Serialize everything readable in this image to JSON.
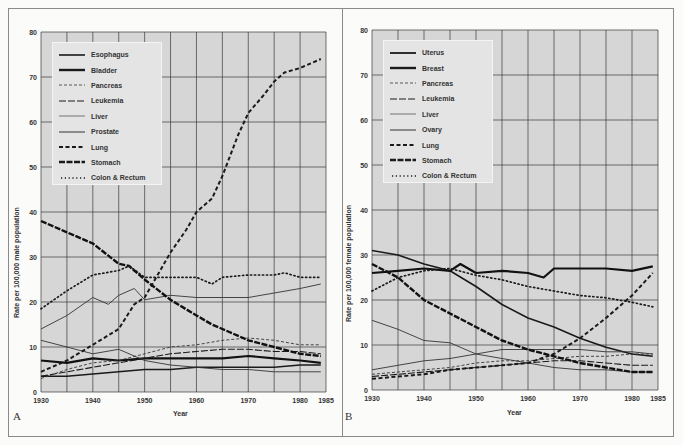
{
  "panels": [
    {
      "letter": "A",
      "ylabel": "Rate per 100,000 male population",
      "xlabel": "Year",
      "legend": [
        "Esophagus",
        "Bladder",
        "Pancreas",
        "Leukemia",
        "Liver",
        "Prostate",
        "Lung",
        "Stomach",
        "Colon & Rectum"
      ]
    },
    {
      "letter": "B",
      "ylabel": "Rate per 100,000 female population",
      "xlabel": "Year",
      "legend": [
        "Uterus",
        "Breast",
        "Pancreas",
        "Leukemia",
        "Liver",
        "Ovary",
        "Lung",
        "Stomach",
        "Colon & Rectum"
      ]
    }
  ],
  "colors": {
    "plot_bg": "#d6d6d6",
    "grid": "#3a3a3a",
    "line": "#1a1a1a",
    "legend_bg": "#e4e4e4"
  },
  "chart_data": [
    {
      "type": "line",
      "title": "A",
      "xlabel": "Year",
      "ylabel": "Rate per 100,000 male population",
      "xlim": [
        1930,
        1985
      ],
      "ylim": [
        0,
        80
      ],
      "xticks": [
        1930,
        1940,
        1950,
        1960,
        1970,
        1980,
        1985
      ],
      "yticks": [
        0,
        10,
        20,
        30,
        40,
        50,
        60,
        70,
        80
      ],
      "grid": true,
      "legend_position": "upper left",
      "series": [
        {
          "name": "Esophagus",
          "style": "solid-medium",
          "x": [
            1930,
            1935,
            1940,
            1945,
            1950,
            1955,
            1960,
            1965,
            1970,
            1975,
            1980,
            1984
          ],
          "y": [
            3.5,
            3.5,
            4,
            4.5,
            5,
            5,
            5.5,
            5.5,
            5.5,
            5.5,
            6,
            6
          ]
        },
        {
          "name": "Bladder",
          "style": "solid-thick",
          "x": [
            1930,
            1935,
            1940,
            1945,
            1950,
            1955,
            1960,
            1965,
            1970,
            1975,
            1980,
            1984
          ],
          "y": [
            7,
            6.5,
            7.5,
            7,
            7.5,
            7.5,
            7.5,
            7.5,
            8,
            7.5,
            7,
            6.5
          ]
        },
        {
          "name": "Pancreas",
          "style": "dashed-thin",
          "x": [
            1930,
            1935,
            1940,
            1945,
            1950,
            1955,
            1960,
            1965,
            1970,
            1975,
            1980,
            1984
          ],
          "y": [
            3,
            5,
            6.5,
            7,
            8.5,
            10,
            10.5,
            11.5,
            12,
            11.5,
            10.5,
            10.5
          ]
        },
        {
          "name": "Leukemia",
          "style": "longdash-medium",
          "x": [
            1930,
            1935,
            1940,
            1945,
            1950,
            1955,
            1960,
            1965,
            1970,
            1975,
            1980,
            1984
          ],
          "y": [
            3.5,
            4.5,
            5.5,
            6.5,
            7.5,
            8.5,
            9,
            9.5,
            9.5,
            9,
            9,
            8.5
          ]
        },
        {
          "name": "Liver",
          "style": "solid-thin",
          "x": [
            1930,
            1935,
            1940,
            1945,
            1950,
            1955,
            1960,
            1965,
            1970,
            1975,
            1980,
            1984
          ],
          "y": [
            11.5,
            10,
            8.5,
            9.5,
            7,
            6,
            5.5,
            5,
            5,
            4.5,
            4.5,
            4.5
          ]
        },
        {
          "name": "Prostate",
          "style": "solid-thin",
          "x": [
            1930,
            1935,
            1940,
            1943,
            1945,
            1948,
            1950,
            1955,
            1960,
            1965,
            1970,
            1975,
            1980,
            1984
          ],
          "y": [
            14,
            17,
            21,
            19.5,
            21.5,
            23,
            20.5,
            21.5,
            21,
            21,
            21,
            22,
            23,
            24
          ]
        },
        {
          "name": "Lung",
          "style": "dashed-thick",
          "x": [
            1930,
            1935,
            1940,
            1945,
            1948,
            1950,
            1953,
            1955,
            1958,
            1960,
            1963,
            1965,
            1968,
            1970,
            1973,
            1975,
            1977,
            1980,
            1984
          ],
          "y": [
            4.5,
            7,
            10.5,
            14,
            19.5,
            21,
            27,
            31,
            36,
            40,
            43,
            48,
            57,
            62,
            66,
            69,
            71,
            72,
            74
          ]
        },
        {
          "name": "Stomach",
          "style": "dashed-heavy",
          "x": [
            1930,
            1935,
            1940,
            1945,
            1947,
            1950,
            1955,
            1960,
            1963,
            1965,
            1970,
            1975,
            1980,
            1984
          ],
          "y": [
            38,
            35.5,
            33,
            28.5,
            28,
            25,
            20.5,
            17,
            15,
            14,
            11.5,
            10,
            8.5,
            8
          ]
        },
        {
          "name": "Colon & Rectum",
          "style": "dotted",
          "x": [
            1930,
            1935,
            1940,
            1945,
            1947,
            1950,
            1955,
            1960,
            1963,
            1965,
            1970,
            1975,
            1977,
            1980,
            1984
          ],
          "y": [
            18.5,
            22.5,
            26,
            27,
            28,
            25.5,
            25.5,
            25.5,
            24,
            25.5,
            26,
            26,
            26.5,
            25.5,
            25.5
          ]
        }
      ]
    },
    {
      "type": "line",
      "title": "B",
      "xlabel": "Year",
      "ylabel": "Rate per 100,000 female population",
      "xlim": [
        1930,
        1985
      ],
      "ylim": [
        0,
        80
      ],
      "xticks": [
        1930,
        1940,
        1950,
        1960,
        1970,
        1980,
        1985
      ],
      "yticks": [
        0,
        10,
        20,
        30,
        40,
        50,
        60,
        70,
        80
      ],
      "grid": true,
      "legend_position": "upper left",
      "series": [
        {
          "name": "Uterus",
          "style": "solid-medium",
          "x": [
            1930,
            1935,
            1940,
            1945,
            1950,
            1955,
            1960,
            1965,
            1970,
            1975,
            1980,
            1984
          ],
          "y": [
            31,
            30,
            28,
            26.5,
            23,
            19,
            16,
            14,
            11.5,
            9.5,
            8,
            7.5
          ]
        },
        {
          "name": "Breast",
          "style": "solid-thick",
          "x": [
            1930,
            1935,
            1940,
            1945,
            1947,
            1950,
            1955,
            1960,
            1963,
            1965,
            1970,
            1975,
            1980,
            1984
          ],
          "y": [
            26,
            26.5,
            27,
            26.5,
            28,
            26,
            26.5,
            26,
            25,
            27,
            27,
            27,
            26.5,
            27.5
          ]
        },
        {
          "name": "Pancreas",
          "style": "dashed-thin",
          "x": [
            1930,
            1935,
            1940,
            1945,
            1950,
            1955,
            1960,
            1965,
            1970,
            1975,
            1980,
            1984
          ],
          "y": [
            3.5,
            4,
            4.5,
            5,
            6,
            6.5,
            6.5,
            7,
            7.5,
            7.5,
            8,
            8
          ]
        },
        {
          "name": "Leukemia",
          "style": "longdash-medium",
          "x": [
            1930,
            1935,
            1940,
            1945,
            1950,
            1955,
            1960,
            1965,
            1970,
            1975,
            1980,
            1984
          ],
          "y": [
            3,
            3.5,
            4,
            4.5,
            5,
            5.5,
            6,
            6.5,
            6.5,
            6,
            5.5,
            5.5
          ]
        },
        {
          "name": "Liver",
          "style": "solid-thin",
          "x": [
            1930,
            1935,
            1940,
            1945,
            1950,
            1955,
            1960,
            1965,
            1970,
            1975,
            1980,
            1984
          ],
          "y": [
            15.5,
            13.5,
            11,
            10.5,
            8,
            7,
            6,
            5,
            4.5,
            4.5,
            4,
            4
          ]
        },
        {
          "name": "Ovary",
          "style": "solid-thin",
          "x": [
            1930,
            1935,
            1940,
            1945,
            1950,
            1955,
            1960,
            1965,
            1970,
            1975,
            1980,
            1984
          ],
          "y": [
            4.5,
            5.5,
            6.5,
            7,
            8,
            9,
            9,
            9,
            9,
            8.5,
            8.5,
            8
          ]
        },
        {
          "name": "Lung",
          "style": "dashed-thick",
          "x": [
            1930,
            1935,
            1940,
            1945,
            1950,
            1955,
            1960,
            1965,
            1970,
            1975,
            1980,
            1984
          ],
          "y": [
            2.5,
            3,
            3.5,
            4.5,
            5,
            5.5,
            6,
            8,
            11.5,
            16,
            21,
            26
          ]
        },
        {
          "name": "Stomach",
          "style": "dashed-heavy",
          "x": [
            1930,
            1935,
            1940,
            1945,
            1950,
            1955,
            1960,
            1965,
            1970,
            1975,
            1980,
            1984
          ],
          "y": [
            28,
            25,
            20,
            17,
            14,
            11,
            9,
            7.5,
            6,
            5,
            4,
            4
          ]
        },
        {
          "name": "Colon & Rectum",
          "style": "dotted",
          "x": [
            1930,
            1935,
            1940,
            1945,
            1950,
            1955,
            1960,
            1965,
            1970,
            1975,
            1980,
            1984
          ],
          "y": [
            22,
            25,
            26.5,
            27,
            25.5,
            24.5,
            23,
            22,
            21,
            20.5,
            19.5,
            18.5
          ]
        }
      ]
    }
  ]
}
